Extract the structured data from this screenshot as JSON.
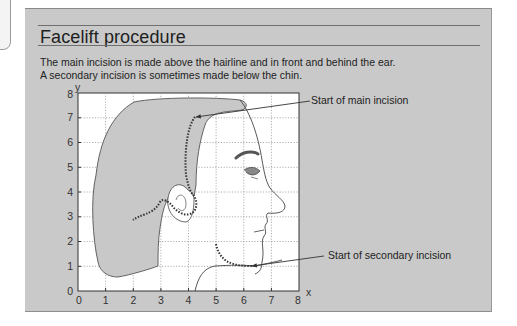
{
  "header": {
    "title": "Facelift procedure",
    "description_lines": [
      "The main incision is made above the hairline and in front and behind the ear.",
      "A secondary incision is sometimes made below the chin."
    ]
  },
  "diagram": {
    "axis": {
      "x_label": "x",
      "y_label": "y",
      "x_ticks": [
        "0",
        "1",
        "2",
        "3",
        "4",
        "5",
        "6",
        "7",
        "8"
      ],
      "y_ticks": [
        "0",
        "1",
        "2",
        "3",
        "4",
        "5",
        "6",
        "7",
        "8"
      ],
      "xlim": [
        0,
        8
      ],
      "ylim": [
        0,
        8
      ],
      "grid": true
    },
    "callouts": {
      "main": "Start of main incision",
      "secondary": "Start of secondary incision"
    },
    "colors": {
      "panel_bg": "#c9c9c9",
      "plot_bg": "#ffffff",
      "hair_fill": "#c8c8c8",
      "incision": "#333333",
      "eyebrow": "#555555"
    }
  }
}
